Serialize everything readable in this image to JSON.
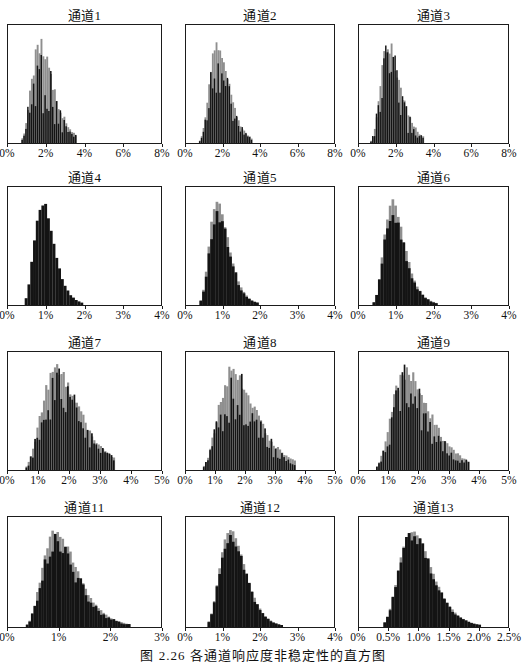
{
  "figure": {
    "caption": "图 2.26  各通道响应度非稳定性的直方图"
  },
  "colors": {
    "bar": "#141414",
    "bar_light": "#8f8f8f",
    "border": "#1b1b1b",
    "background": "#ffffff",
    "text": "#111111"
  },
  "chart_data": [
    {
      "type": "bar",
      "subtype": "histogram",
      "channel": 1,
      "title": "通道1",
      "xlim": [
        0,
        8
      ],
      "x_ticks": [
        "0%",
        "2%",
        "4%",
        "6%",
        "8%"
      ],
      "x_tick_values": [
        0,
        2,
        4,
        6,
        8
      ],
      "ylabel": "",
      "grid": false,
      "legend": false,
      "distribution": {
        "shape": "lognormal",
        "mode_pct": 1.7,
        "sigma": 0.33,
        "range_pct": [
          0.35,
          3.6
        ]
      },
      "style": {
        "bins": 80,
        "jitter": 0.72,
        "seed": 1
      }
    },
    {
      "type": "bar",
      "subtype": "histogram",
      "channel": 2,
      "title": "通道2",
      "xlim": [
        0,
        8
      ],
      "x_ticks": [
        "0%",
        "2%",
        "4%",
        "6%",
        "8%"
      ],
      "x_tick_values": [
        0,
        2,
        4,
        6,
        8
      ],
      "ylabel": "",
      "grid": false,
      "legend": false,
      "distribution": {
        "shape": "lognormal",
        "mode_pct": 1.7,
        "sigma": 0.3,
        "range_pct": [
          0.4,
          3.6
        ]
      },
      "style": {
        "bins": 80,
        "jitter": 0.55,
        "seed": 2
      }
    },
    {
      "type": "bar",
      "subtype": "histogram",
      "channel": 3,
      "title": "通道3",
      "xlim": [
        0,
        8
      ],
      "x_ticks": [
        "0%",
        "2%",
        "4%",
        "6%",
        "8%"
      ],
      "x_tick_values": [
        0,
        2,
        4,
        6,
        8
      ],
      "ylabel": "",
      "grid": false,
      "legend": false,
      "distribution": {
        "shape": "lognormal",
        "mode_pct": 1.6,
        "sigma": 0.33,
        "range_pct": [
          0.35,
          3.5
        ]
      },
      "style": {
        "bins": 80,
        "jitter": 0.7,
        "seed": 3
      }
    },
    {
      "type": "bar",
      "subtype": "histogram",
      "channel": 4,
      "title": "通道4",
      "xlim": [
        0,
        4
      ],
      "x_ticks": [
        "0%",
        "1%",
        "2%",
        "3%",
        "4%"
      ],
      "x_tick_values": [
        0,
        1,
        2,
        3,
        4
      ],
      "ylabel": "",
      "grid": false,
      "legend": false,
      "distribution": {
        "shape": "lognormal",
        "mode_pct": 0.9,
        "sigma": 0.28,
        "range_pct": [
          0.25,
          2.2
        ]
      },
      "style": {
        "bins": 55,
        "jitter": 0.1,
        "seed": 4
      }
    },
    {
      "type": "bar",
      "subtype": "histogram",
      "channel": 5,
      "title": "通道5",
      "xlim": [
        0,
        4
      ],
      "x_ticks": [
        "0%",
        "1%",
        "2%",
        "3%",
        "4%"
      ],
      "x_tick_values": [
        0,
        1,
        2,
        3,
        4
      ],
      "ylabel": "",
      "grid": false,
      "legend": false,
      "distribution": {
        "shape": "lognormal",
        "mode_pct": 0.85,
        "sigma": 0.3,
        "range_pct": [
          0.2,
          2.1
        ]
      },
      "style": {
        "bins": 55,
        "jitter": 0.22,
        "seed": 5
      }
    },
    {
      "type": "bar",
      "subtype": "histogram",
      "channel": 6,
      "title": "通道6",
      "xlim": [
        0,
        4
      ],
      "x_ticks": [
        "0%",
        "1%",
        "2%",
        "3%",
        "4%"
      ],
      "x_tick_values": [
        0,
        1,
        2,
        3,
        4
      ],
      "ylabel": "",
      "grid": false,
      "legend": false,
      "distribution": {
        "shape": "lognormal",
        "mode_pct": 0.9,
        "sigma": 0.3,
        "range_pct": [
          0.25,
          2.3
        ]
      },
      "style": {
        "bins": 55,
        "jitter": 0.22,
        "seed": 6
      }
    },
    {
      "type": "bar",
      "subtype": "histogram",
      "channel": 7,
      "title": "通道7",
      "xlim": [
        0,
        5
      ],
      "x_ticks": [
        "0%",
        "1%",
        "2%",
        "3%",
        "4%",
        "5%"
      ],
      "x_tick_values": [
        0,
        1,
        2,
        3,
        4,
        5
      ],
      "ylabel": "",
      "grid": false,
      "legend": false,
      "distribution": {
        "shape": "lognormal",
        "mode_pct": 1.6,
        "sigma": 0.38,
        "range_pct": [
          0.4,
          3.5
        ]
      },
      "style": {
        "bins": 70,
        "jitter": 0.5,
        "seed": 7
      }
    },
    {
      "type": "bar",
      "subtype": "histogram",
      "channel": 8,
      "title": "通道8",
      "xlim": [
        0,
        5
      ],
      "x_ticks": [
        "0%",
        "1%",
        "2%",
        "3%",
        "4%",
        "5%"
      ],
      "x_tick_values": [
        0,
        1,
        2,
        3,
        4,
        5
      ],
      "ylabel": "",
      "grid": false,
      "legend": false,
      "distribution": {
        "shape": "lognormal",
        "mode_pct": 1.6,
        "sigma": 0.38,
        "range_pct": [
          0.45,
          3.7
        ]
      },
      "style": {
        "bins": 70,
        "jitter": 0.55,
        "seed": 8
      }
    },
    {
      "type": "bar",
      "subtype": "histogram",
      "channel": 9,
      "title": "通道9",
      "xlim": [
        0,
        5
      ],
      "x_ticks": [
        "0%",
        "1%",
        "2%",
        "3%",
        "4%",
        "5%"
      ],
      "x_tick_values": [
        0,
        1,
        2,
        3,
        4,
        5
      ],
      "ylabel": "",
      "grid": false,
      "legend": false,
      "distribution": {
        "shape": "lognormal",
        "mode_pct": 1.6,
        "sigma": 0.38,
        "range_pct": [
          0.45,
          3.7
        ]
      },
      "style": {
        "bins": 70,
        "jitter": 0.55,
        "seed": 9
      }
    },
    {
      "type": "bar",
      "subtype": "histogram",
      "channel": 11,
      "title": "通道11",
      "xlim": [
        0,
        3
      ],
      "x_ticks": [
        "0%",
        "1%",
        "2%",
        "3%"
      ],
      "x_tick_values": [
        0,
        1,
        2,
        3
      ],
      "ylabel": "",
      "grid": false,
      "legend": false,
      "distribution": {
        "shape": "lognormal",
        "mode_pct": 0.95,
        "sigma": 0.35,
        "range_pct": [
          0.25,
          2.4
        ]
      },
      "style": {
        "bins": 60,
        "jitter": 0.3,
        "seed": 10
      }
    },
    {
      "type": "bar",
      "subtype": "histogram",
      "channel": 12,
      "title": "通道12",
      "xlim": [
        0,
        4
      ],
      "x_ticks": [
        "0%",
        "1%",
        "2%",
        "3%",
        "4%"
      ],
      "x_tick_values": [
        0,
        1,
        2,
        3,
        4
      ],
      "ylabel": "",
      "grid": false,
      "legend": false,
      "distribution": {
        "shape": "lognormal",
        "mode_pct": 1.2,
        "sigma": 0.28,
        "range_pct": [
          0.4,
          2.9
        ]
      },
      "style": {
        "bins": 55,
        "jitter": 0.15,
        "seed": 11
      }
    },
    {
      "type": "bar",
      "subtype": "histogram",
      "channel": 13,
      "title": "通道13",
      "xlim": [
        0,
        2.5
      ],
      "x_ticks": [
        "0%",
        "0.5%",
        "1.0%",
        "1.5%",
        "2.0%",
        "2.5%"
      ],
      "x_tick_values": [
        0,
        0.5,
        1,
        1.5,
        2,
        2.5
      ],
      "ylabel": "",
      "grid": false,
      "legend": false,
      "distribution": {
        "shape": "lognormal",
        "mode_pct": 0.9,
        "sigma": 0.3,
        "range_pct": [
          0.25,
          2.05
        ]
      },
      "style": {
        "bins": 55,
        "jitter": 0.15,
        "seed": 12
      }
    }
  ]
}
